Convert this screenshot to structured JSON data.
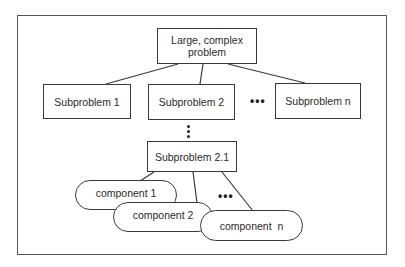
{
  "diagram": {
    "root": {
      "label_line1": "Large, complex",
      "label_line2": "problem"
    },
    "subproblems": [
      {
        "label": "Subproblem 1"
      },
      {
        "label": "Subproblem 2"
      },
      {
        "label": "Subproblem n"
      }
    ],
    "subproblem_ellipsis": "•••",
    "nested_subproblem": {
      "label": "Subproblem 2.1"
    },
    "components": [
      {
        "label": "component 1"
      },
      {
        "label": "component 2"
      },
      {
        "label": "component  n"
      }
    ],
    "component_ellipsis": "•••",
    "colors": {
      "stroke": "#3a3a3a",
      "background": "#ffffff",
      "text": "#2a2a2a"
    }
  }
}
